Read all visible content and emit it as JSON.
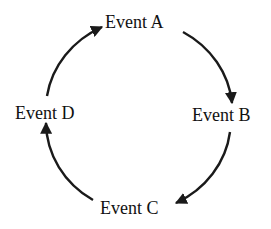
{
  "diagram": {
    "type": "cycle",
    "nodes": [
      {
        "id": "A",
        "label": "Event A"
      },
      {
        "id": "B",
        "label": "Event B"
      },
      {
        "id": "C",
        "label": "Event C"
      },
      {
        "id": "D",
        "label": "Event D"
      }
    ],
    "edges": [
      {
        "from": "A",
        "to": "B"
      },
      {
        "from": "B",
        "to": "C"
      },
      {
        "from": "C",
        "to": "D"
      },
      {
        "from": "D",
        "to": "A"
      }
    ],
    "colors": {
      "line": "#1a1a1a",
      "background": "#ffffff"
    }
  }
}
